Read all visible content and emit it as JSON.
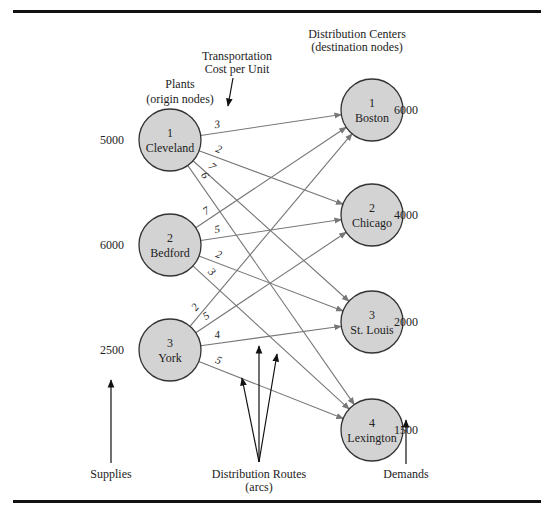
{
  "title_labels": {
    "plants": "Plants",
    "plants_sub": "(origin nodes)",
    "dc": "Distribution Centers",
    "dc_sub": "(destination nodes)",
    "cost": "Transportation",
    "cost_sub": "Cost per Unit",
    "supplies": "Supplies",
    "routes": "Distribution Routes",
    "routes_sub": "(arcs)",
    "demands": "Demands"
  },
  "origins": [
    {
      "id": "1",
      "name": "Cleveland",
      "supply": "5000"
    },
    {
      "id": "2",
      "name": "Bedford",
      "supply": "6000"
    },
    {
      "id": "3",
      "name": "York",
      "supply": "2500"
    }
  ],
  "destinations": [
    {
      "id": "1",
      "name": "Boston",
      "demand": "6000"
    },
    {
      "id": "2",
      "name": "Chicago",
      "demand": "4000"
    },
    {
      "id": "3",
      "name": "St. Louis",
      "demand": "2000"
    },
    {
      "id": "4",
      "name": "Lexington",
      "demand": "1500"
    }
  ],
  "costs": [
    [
      "3",
      "2",
      "7",
      "6"
    ],
    [
      "7",
      "5",
      "2",
      "3"
    ],
    [
      "2",
      "5",
      "4",
      "5"
    ]
  ],
  "colors": {
    "node_fill": "#d3d3d3",
    "arc": "#777777",
    "text": "#222222"
  }
}
